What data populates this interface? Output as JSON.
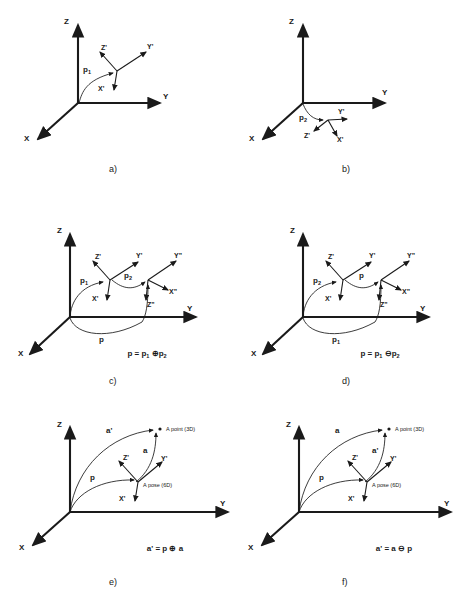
{
  "figure": {
    "background_color": "#ffffff",
    "ink_color": "#1a1a1a",
    "axes": {
      "x": "X",
      "y": "Y",
      "z": "Z"
    },
    "frame_primed": {
      "x": "X'",
      "y": "Y'",
      "z": "Z'"
    },
    "frame_double_primed": {
      "x": "X\"",
      "y": "Y\"",
      "z": "Z\""
    },
    "operators": {
      "oplus": "⊕",
      "ominus": "⊖"
    }
  },
  "panels": [
    {
      "id": "a",
      "caption": "a)",
      "curves": [
        {
          "label": "p",
          "sub": "1"
        }
      ],
      "frames": [
        {
          "x": "X'",
          "y": "Y'",
          "z": "Z'"
        }
      ],
      "equation": "",
      "annotations": []
    },
    {
      "id": "b",
      "caption": "b)",
      "curves": [
        {
          "label": "p",
          "sub": "2"
        }
      ],
      "frames": [
        {
          "x": "X'",
          "y": "Y'",
          "z": "Z'"
        }
      ],
      "equation": "",
      "annotations": []
    },
    {
      "id": "c",
      "caption": "c)",
      "curves": [
        {
          "label": "p",
          "sub": "1"
        },
        {
          "label": "p",
          "sub": "2"
        },
        {
          "label": "p",
          "sub": ""
        }
      ],
      "frames": [
        {
          "x": "X'",
          "y": "Y'",
          "z": "Z'"
        },
        {
          "x": "X\"",
          "y": "Y\"",
          "z": "Z\""
        }
      ],
      "equation": "p = p₁ ⊕ p₂",
      "equation_parts": {
        "lhs": "p",
        "op": "⊕",
        "arg1": "p",
        "arg1_sub": "1",
        "arg2": "p",
        "arg2_sub": "2"
      },
      "annotations": []
    },
    {
      "id": "d",
      "caption": "d)",
      "curves": [
        {
          "label": "p",
          "sub": "2"
        },
        {
          "label": "p",
          "sub": ""
        },
        {
          "label": "p",
          "sub": "1"
        }
      ],
      "frames": [
        {
          "x": "X'",
          "y": "Y'",
          "z": "Z'"
        },
        {
          "x": "X\"",
          "y": "Y\"",
          "z": "Z\""
        }
      ],
      "equation": "p = p₁ ⊖ p₂",
      "equation_parts": {
        "lhs": "p",
        "op": "⊖",
        "arg1": "p",
        "arg1_sub": "1",
        "arg2": "p",
        "arg2_sub": "2"
      },
      "annotations": []
    },
    {
      "id": "e",
      "caption": "e)",
      "curves": [
        {
          "label": "a'",
          "sub": ""
        },
        {
          "label": "a",
          "sub": ""
        },
        {
          "label": "p",
          "sub": ""
        }
      ],
      "frames": [
        {
          "x": "X'",
          "y": "Y'",
          "z": "Z'"
        }
      ],
      "equation": "a' = p ⊕ a",
      "equation_parts": {
        "lhs": "a'",
        "op": "⊕",
        "arg1": "p",
        "arg2": "a"
      },
      "annotations": [
        "A point (3D)",
        "A pose (6D)"
      ]
    },
    {
      "id": "f",
      "caption": "f)",
      "curves": [
        {
          "label": "a",
          "sub": ""
        },
        {
          "label": "a'",
          "sub": ""
        },
        {
          "label": "p",
          "sub": ""
        }
      ],
      "frames": [
        {
          "x": "X'",
          "y": "Y'",
          "z": "Z'"
        }
      ],
      "equation": "a' = a ⊖ p",
      "equation_parts": {
        "lhs": "a'",
        "op": "⊖",
        "arg1": "a",
        "arg2": "p"
      },
      "annotations": [
        "A point (3D)",
        "A pose (6D)"
      ]
    }
  ]
}
